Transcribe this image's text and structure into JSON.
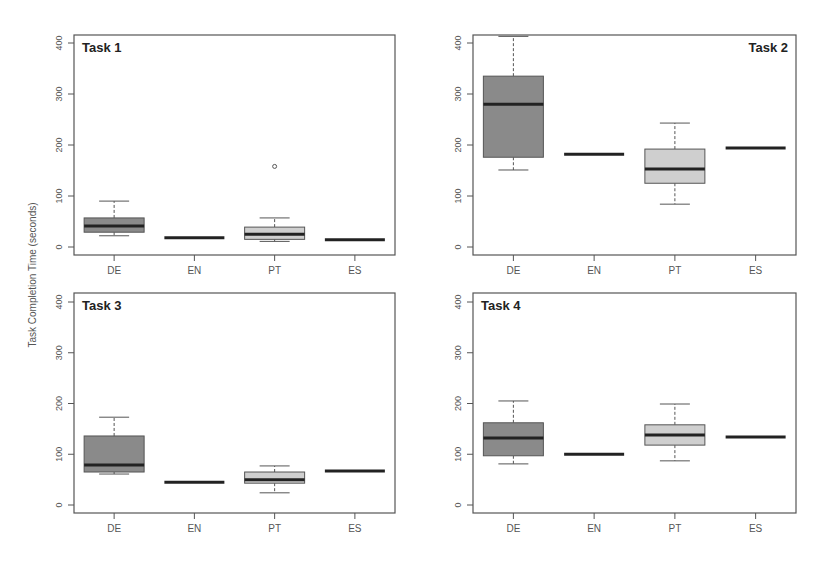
{
  "figure": {
    "ylabel": "Task Completion Time (seconds)",
    "colors": {
      "DE": "#8a8a8a",
      "EN": "#ffffff",
      "PT": "#cfcfcf",
      "ES": "#ffffff",
      "median": "#222222",
      "frame": "#555555"
    }
  },
  "chart_data": [
    {
      "type": "boxplot",
      "title": "Task 1",
      "title_position": "top-left",
      "xlabel": "",
      "ylabel": "Task Completion Time (seconds)",
      "categories": [
        "DE",
        "EN",
        "PT",
        "ES"
      ],
      "yticks": [
        0,
        100,
        200,
        300,
        400
      ],
      "ylim": [
        -10,
        420
      ],
      "boxes": [
        {
          "label": "DE",
          "whisker_low": 22,
          "q1": 29,
          "median": 41,
          "q3": 57,
          "whisker_high": 90,
          "outliers": []
        },
        {
          "label": "EN",
          "whisker_low": 18,
          "q1": 18,
          "median": 18,
          "q3": 18,
          "whisker_high": 18,
          "outliers": []
        },
        {
          "label": "PT",
          "whisker_low": 11,
          "q1": 15,
          "median": 25,
          "q3": 39,
          "whisker_high": 57,
          "outliers": [
            158
          ]
        },
        {
          "label": "ES",
          "whisker_low": 14,
          "q1": 14,
          "median": 14,
          "q3": 14,
          "whisker_high": 14,
          "outliers": []
        }
      ]
    },
    {
      "type": "boxplot",
      "title": "Task 2",
      "title_position": "top-right",
      "xlabel": "",
      "ylabel": "Task Completion Time (seconds)",
      "categories": [
        "DE",
        "EN",
        "PT",
        "ES"
      ],
      "yticks": [
        0,
        100,
        200,
        300,
        400
      ],
      "ylim": [
        -10,
        420
      ],
      "boxes": [
        {
          "label": "DE",
          "whisker_low": 151,
          "q1": 176,
          "median": 280,
          "q3": 335,
          "whisker_high": 413,
          "outliers": []
        },
        {
          "label": "EN",
          "whisker_low": 182,
          "q1": 182,
          "median": 182,
          "q3": 182,
          "whisker_high": 182,
          "outliers": []
        },
        {
          "label": "PT",
          "whisker_low": 84,
          "q1": 125,
          "median": 153,
          "q3": 192,
          "whisker_high": 243,
          "outliers": []
        },
        {
          "label": "ES",
          "whisker_low": 194,
          "q1": 194,
          "median": 194,
          "q3": 194,
          "whisker_high": 194,
          "outliers": []
        }
      ]
    },
    {
      "type": "boxplot",
      "title": "Task 3",
      "title_position": "top-left",
      "xlabel": "",
      "ylabel": "Task Completion Time (seconds)",
      "categories": [
        "DE",
        "EN",
        "PT",
        "ES"
      ],
      "yticks": [
        0,
        100,
        200,
        300,
        400
      ],
      "ylim": [
        -10,
        420
      ],
      "boxes": [
        {
          "label": "DE",
          "whisker_low": 61,
          "q1": 65,
          "median": 79,
          "q3": 136,
          "whisker_high": 173,
          "outliers": []
        },
        {
          "label": "EN",
          "whisker_low": 45,
          "q1": 45,
          "median": 45,
          "q3": 45,
          "whisker_high": 45,
          "outliers": []
        },
        {
          "label": "PT",
          "whisker_low": 24,
          "q1": 43,
          "median": 50,
          "q3": 65,
          "whisker_high": 77,
          "outliers": []
        },
        {
          "label": "ES",
          "whisker_low": 67,
          "q1": 67,
          "median": 67,
          "q3": 67,
          "whisker_high": 67,
          "outliers": []
        }
      ]
    },
    {
      "type": "boxplot",
      "title": "Task 4",
      "title_position": "top-left",
      "xlabel": "",
      "ylabel": "Task Completion Time (seconds)",
      "categories": [
        "DE",
        "EN",
        "PT",
        "ES"
      ],
      "yticks": [
        0,
        100,
        200,
        300,
        400
      ],
      "ylim": [
        -10,
        420
      ],
      "boxes": [
        {
          "label": "DE",
          "whisker_low": 81,
          "q1": 97,
          "median": 132,
          "q3": 162,
          "whisker_high": 205,
          "outliers": []
        },
        {
          "label": "EN",
          "whisker_low": 100,
          "q1": 100,
          "median": 100,
          "q3": 100,
          "whisker_high": 100,
          "outliers": []
        },
        {
          "label": "PT",
          "whisker_low": 87,
          "q1": 118,
          "median": 138,
          "q3": 158,
          "whisker_high": 199,
          "outliers": []
        },
        {
          "label": "ES",
          "whisker_low": 134,
          "q1": 134,
          "median": 134,
          "q3": 134,
          "whisker_high": 134,
          "outliers": []
        }
      ]
    }
  ]
}
